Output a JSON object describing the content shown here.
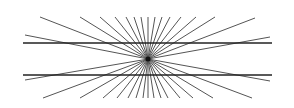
{
  "figure": {
    "name": "Hering illusion",
    "background": "#ffffff",
    "ray_color": "#555555",
    "line_color": "#222222",
    "center": [
      148,
      59
    ],
    "horizontal_lines": [
      {
        "x1": 23,
        "x2": 272,
        "y": 43
      },
      {
        "x1": 23,
        "x2": 272,
        "y": 75
      }
    ],
    "ray_endpoints": [
      [
        40,
        17
      ],
      [
        80,
        17
      ],
      [
        100,
        17
      ],
      [
        115,
        17
      ],
      [
        126,
        17
      ],
      [
        134,
        17
      ],
      [
        141,
        17
      ],
      [
        148,
        17
      ],
      [
        155,
        17
      ],
      [
        162,
        17
      ],
      [
        170,
        17
      ],
      [
        181,
        17
      ],
      [
        196,
        17
      ],
      [
        215,
        17
      ],
      [
        255,
        18
      ],
      [
        25,
        35
      ],
      [
        270,
        37
      ],
      [
        25,
        80
      ],
      [
        270,
        81
      ],
      [
        43,
        98
      ],
      [
        80,
        98
      ],
      [
        103,
        98
      ],
      [
        117,
        98
      ],
      [
        128,
        98
      ],
      [
        136,
        98
      ],
      [
        143,
        98
      ],
      [
        148,
        98
      ],
      [
        154,
        98
      ],
      [
        161,
        98
      ],
      [
        168,
        98
      ],
      [
        180,
        98
      ],
      [
        193,
        98
      ],
      [
        213,
        98
      ],
      [
        252,
        98
      ]
    ]
  }
}
